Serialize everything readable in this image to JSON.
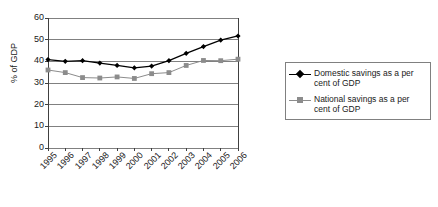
{
  "chart_data": {
    "type": "line",
    "title": "",
    "xlabel": "",
    "ylabel": "% of GDP",
    "ylim": [
      0,
      60
    ],
    "y_ticks": [
      0,
      10,
      20,
      30,
      40,
      50,
      60
    ],
    "grid": true,
    "legend_position": "right",
    "categories": [
      "1995",
      "1996",
      "1997",
      "1998",
      "1999",
      "2000",
      "2001",
      "2002",
      "2003",
      "2004",
      "2005",
      "2006"
    ],
    "series": [
      {
        "name": "Domestic savings as a per cent of GDP",
        "marker": "diamond",
        "color": "#000000",
        "values": [
          40.8,
          40.0,
          40.3,
          39.2,
          38.1,
          37.0,
          37.8,
          40.3,
          43.7,
          46.8,
          49.8,
          51.7
        ]
      },
      {
        "name": "National savings as a per cent of GDP",
        "marker": "square",
        "color": "#8c8c8c",
        "values": [
          36.0,
          34.8,
          32.5,
          32.3,
          32.8,
          32.1,
          34.3,
          34.8,
          38.1,
          40.4,
          40.3,
          41.0
        ]
      }
    ]
  },
  "axis": {
    "y_title": "% of GDP"
  },
  "legend": {
    "items": [
      {
        "label": "Domestic savings as a per cent of GDP",
        "marker": "diamond",
        "color": "#000000"
      },
      {
        "label": "National savings as a per cent of GDP",
        "marker": "square",
        "color": "#8c8c8c"
      }
    ]
  },
  "colors": {
    "domestic": "#000000",
    "national": "#8c8c8c",
    "grid": "#808080",
    "axis": "#404040"
  }
}
